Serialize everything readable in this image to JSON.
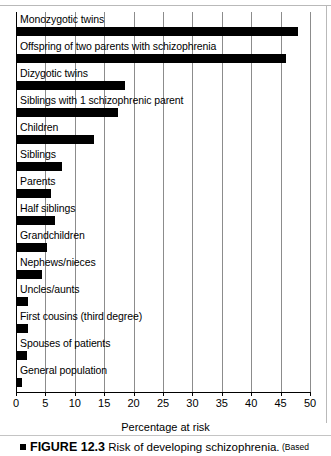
{
  "chart_data": {
    "type": "bar",
    "orientation": "horizontal",
    "title": "Risk of developing schizophrenia",
    "xlabel": "Percentage at risk",
    "ylabel": "",
    "xlim": [
      0,
      50
    ],
    "xticks": [
      0,
      5,
      10,
      15,
      20,
      25,
      30,
      35,
      40,
      45,
      50
    ],
    "xticklabels": [
      "0",
      "5",
      "10",
      "15",
      "20",
      "25",
      "30",
      "35",
      "40",
      "45",
      "50"
    ],
    "grid": true,
    "legend": false,
    "bar_color": "#000000",
    "categories": [
      "Monozygotic twins",
      "Offspring of two parents with schizophrenia",
      "Dizygotic twins",
      "Siblings with 1 schizophrenic parent",
      "Children",
      "Siblings",
      "Parents",
      "Half siblings",
      "Grandchildren",
      "Nephews/nieces",
      "Uncles/aunts",
      "First cousins (third degree)",
      "Spouses of patients",
      "General population"
    ],
    "values": [
      48,
      46,
      18.5,
      17.3,
      13.3,
      7.8,
      6,
      6.6,
      5.3,
      4.4,
      2,
      2,
      1.8,
      1
    ]
  },
  "caption": {
    "marker": "■",
    "figure_number": "FIGURE 12.3",
    "title": "Risk of developing schizophrenia.",
    "source": "(Based"
  }
}
